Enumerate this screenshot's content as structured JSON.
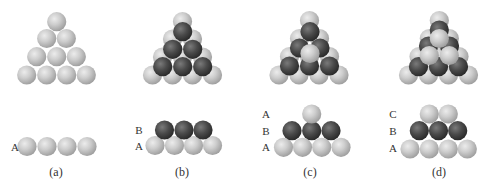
{
  "figure": {
    "colors": {
      "light_sphere": "#c9c9c9",
      "dark_sphere": "#4a4a4a",
      "background": "#ffffff",
      "text": "#333333"
    },
    "sphere_radius": 9.6,
    "panels": [
      {
        "id": "a",
        "caption": "(a)",
        "caption_pos": [
          56,
          176
        ],
        "top_view": [
          {
            "layer": "A",
            "shade": "light",
            "centers": [
              [
                56.7,
                21.7
              ],
              [
                46.7,
                38.5
              ],
              [
                66.3,
                38.5
              ],
              [
                36.7,
                56.7
              ],
              [
                56.7,
                56.7
              ],
              [
                76.3,
                56.7
              ],
              [
                26.7,
                75
              ],
              [
                46.7,
                75
              ],
              [
                66.7,
                75
              ],
              [
                86.3,
                75
              ]
            ]
          }
        ],
        "side_view": {
          "labels": [
            {
              "text": "A",
              "x": 15,
              "y": 151
            }
          ],
          "layers": [
            {
              "layer": "A",
              "shade": "light",
              "centers": [
                [
                  27,
                  146.5
                ],
                [
                  47,
                  146.5
                ],
                [
                  67,
                  146.5
                ],
                [
                  87,
                  146.5
                ]
              ]
            }
          ]
        }
      },
      {
        "id": "b",
        "caption": "(b)",
        "caption_pos": [
          182,
          176
        ],
        "top_view": [
          {
            "layer": "A",
            "shade": "light",
            "centers": [
              [
                182.5,
                21.5
              ],
              [
                172.5,
                39
              ],
              [
                192.5,
                39
              ],
              [
                162.5,
                57
              ],
              [
                182.5,
                57
              ],
              [
                202.5,
                57
              ],
              [
                152.5,
                75
              ],
              [
                172.5,
                75
              ],
              [
                192.5,
                75
              ],
              [
                212.5,
                75
              ]
            ]
          },
          {
            "layer": "B",
            "shade": "dark",
            "centers": [
              [
                182.7,
                31.7
              ],
              [
                172.7,
                49.3
              ],
              [
                192.7,
                49.3
              ],
              [
                162.7,
                66.7
              ],
              [
                182.7,
                66.7
              ],
              [
                202.7,
                66.7
              ]
            ]
          }
        ],
        "side_view": {
          "labels": [
            {
              "text": "B",
              "x": 139,
              "y": 134
            },
            {
              "text": "A",
              "x": 139,
              "y": 150
            }
          ],
          "layers": [
            {
              "layer": "A",
              "shade": "light",
              "centers": [
                [
                  155,
                  145.5
                ],
                [
                  174.5,
                  145.5
                ],
                [
                  193.5,
                  145.5
                ],
                [
                  212.5,
                  145.5
                ]
              ]
            },
            {
              "layer": "B",
              "shade": "dark",
              "centers": [
                [
                  164.5,
                  130
                ],
                [
                  184,
                  130
                ],
                [
                  203,
                  130
                ]
              ]
            }
          ]
        }
      },
      {
        "id": "c",
        "caption": "(c)",
        "caption_pos": [
          310,
          176
        ],
        "top_view": [
          {
            "layer": "A",
            "shade": "light",
            "centers": [
              [
                309.5,
                20.5
              ],
              [
                299.5,
                38.5
              ],
              [
                319.5,
                38.5
              ],
              [
                289.5,
                56.5
              ],
              [
                309.5,
                56.5
              ],
              [
                329.5,
                56.5
              ],
              [
                279,
                75
              ],
              [
                299,
                75
              ],
              [
                319,
                75
              ],
              [
                339,
                75
              ]
            ]
          },
          {
            "layer": "B",
            "shade": "dark",
            "centers": [
              [
                310,
                31.7
              ],
              [
                299.5,
                48
              ],
              [
                320,
                48
              ],
              [
                289.5,
                66
              ],
              [
                309.5,
                66
              ],
              [
                329.5,
                66
              ]
            ]
          },
          {
            "layer": "A",
            "shade": "light",
            "centers": [
              [
                310,
                53.5
              ]
            ]
          }
        ],
        "side_view": {
          "labels": [
            {
              "text": "A",
              "x": 266,
              "y": 118
            },
            {
              "text": "B",
              "x": 266,
              "y": 135
            },
            {
              "text": "A",
              "x": 266,
              "y": 151
            }
          ],
          "layers": [
            {
              "layer": "A",
              "shade": "light",
              "centers": [
                [
                  283.5,
                  147.3
                ],
                [
                  302.5,
                  147.3
                ],
                [
                  321.7,
                  147.3
                ],
                [
                  341,
                  147.3
                ]
              ]
            },
            {
              "layer": "B",
              "shade": "dark",
              "centers": [
                [
                  292,
                  130.7
                ],
                [
                  311.7,
                  130.7
                ],
                [
                  331,
                  130.7
                ]
              ]
            },
            {
              "layer": "A",
              "shade": "light",
              "centers": [
                [
                  311.7,
                  114
                ]
              ]
            }
          ]
        }
      },
      {
        "id": "d",
        "caption": "(d)",
        "caption_pos": [
          439,
          176
        ],
        "top_view": [
          {
            "layer": "A",
            "shade": "light",
            "centers": [
              [
                439.3,
                20.5
              ],
              [
                429.3,
                38.5
              ],
              [
                449.3,
                38.5
              ],
              [
                419,
                56.5
              ],
              [
                439,
                56.5
              ],
              [
                459,
                56.5
              ],
              [
                408.5,
                75
              ],
              [
                428.5,
                75
              ],
              [
                448.5,
                75
              ],
              [
                468.5,
                75
              ]
            ]
          },
          {
            "layer": "B",
            "shade": "dark",
            "centers": [
              [
                439.3,
                30
              ],
              [
                428.5,
                46
              ],
              [
                449.5,
                46
              ],
              [
                418.5,
                66.7
              ],
              [
                438.5,
                66.7
              ],
              [
                458.5,
                66.7
              ]
            ]
          },
          {
            "layer": "C",
            "shade": "light",
            "centers": [
              [
                439.3,
                38.5
              ],
              [
                429.3,
                55.5
              ],
              [
                449.3,
                55.5
              ]
            ]
          }
        ],
        "side_view": {
          "labels": [
            {
              "text": "C",
              "x": 393,
              "y": 118
            },
            {
              "text": "B",
              "x": 393,
              "y": 135
            },
            {
              "text": "A",
              "x": 393,
              "y": 152
            }
          ],
          "layers": [
            {
              "layer": "A",
              "shade": "light",
              "centers": [
                [
                  410,
                  149
                ],
                [
                  429.3,
                  149
                ],
                [
                  448.3,
                  149
                ],
                [
                  467.3,
                  149
                ]
              ]
            },
            {
              "layer": "B",
              "shade": "dark",
              "centers": [
                [
                  419.3,
                  130.7
                ],
                [
                  438.5,
                  130.7
                ],
                [
                  457.7,
                  130.7
                ]
              ]
            },
            {
              "layer": "C",
              "shade": "light",
              "centers": [
                [
                  429.3,
                  114
                ],
                [
                  448.3,
                  114
                ]
              ]
            }
          ]
        }
      }
    ]
  }
}
